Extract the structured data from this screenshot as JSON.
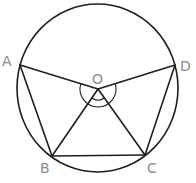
{
  "diagram": {
    "type": "circle-geometry",
    "circle": {
      "cx": 97.5,
      "cy": 88,
      "rx": 80.5,
      "ry": 84
    },
    "center": {
      "label": "O",
      "x": 98,
      "y": 89
    },
    "points": [
      {
        "label": "A",
        "x": 20,
        "y": 65
      },
      {
        "label": "B",
        "x": 52,
        "y": 156
      },
      {
        "label": "C",
        "x": 145,
        "y": 155
      },
      {
        "label": "D",
        "x": 175,
        "y": 65
      }
    ],
    "segments": [
      "AB",
      "BC",
      "CD",
      "OA",
      "OB",
      "OC",
      "OD"
    ],
    "angle_marks": [
      {
        "at": "O",
        "between": [
          "OA",
          "OD"
        ],
        "style": "large-arc-below"
      },
      {
        "at": "O",
        "between": [
          "OB",
          "OC"
        ],
        "style": "small-arc"
      }
    ],
    "labels": {
      "A": "A",
      "B": "B",
      "C": "C",
      "D": "D",
      "O": "O"
    },
    "colors": {
      "line": "#1e1e1e",
      "label": "#8a8a8a"
    }
  }
}
